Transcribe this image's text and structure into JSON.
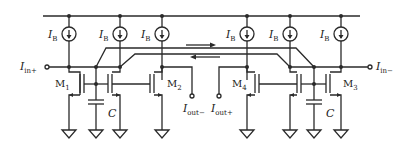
{
  "diagram": {
    "type": "circuit-schematic",
    "current_sources": [
      {
        "id": "ib1",
        "label": "I",
        "sub": "B",
        "x": 69
      },
      {
        "id": "ib2",
        "label": "I",
        "sub": "B",
        "x": 120
      },
      {
        "id": "ib3",
        "label": "I",
        "sub": "B",
        "x": 162
      },
      {
        "id": "ib4",
        "label": "I",
        "sub": "B",
        "x": 247
      },
      {
        "id": "ib5",
        "label": "I",
        "sub": "B",
        "x": 290
      },
      {
        "id": "ib6",
        "label": "I",
        "sub": "B",
        "x": 341
      }
    ],
    "transistors": [
      {
        "id": "m1",
        "label": "M",
        "sub": "1"
      },
      {
        "id": "m2",
        "label": "M",
        "sub": "2"
      },
      {
        "id": "m3",
        "label": "M",
        "sub": "3"
      },
      {
        "id": "m4",
        "label": "M",
        "sub": "4"
      }
    ],
    "capacitors": [
      {
        "id": "c-left",
        "label": "C"
      },
      {
        "id": "c-right",
        "label": "C"
      }
    ],
    "ports": {
      "in_plus": {
        "label": "I",
        "sub": "in+"
      },
      "in_minus": {
        "label": "I",
        "sub": "in−"
      },
      "out_minus": {
        "label": "I",
        "sub": "out−"
      },
      "out_plus": {
        "label": "I",
        "sub": "out+"
      }
    },
    "arrows": [
      {
        "direction": "right"
      },
      {
        "direction": "left"
      }
    ],
    "colors": {
      "line": "#2a2a2a",
      "background": "#ffffff"
    }
  }
}
